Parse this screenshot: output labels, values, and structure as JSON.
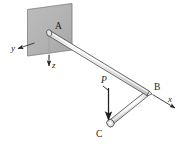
{
  "figure": {
    "kind": "engineering-mechanics-diagram",
    "colors": {
      "plate_fill": "#b4b4b4",
      "plate_stroke": "#6e6e6e",
      "pipe_fill": "#f2f2f2",
      "pipe_stroke": "#3c3c3c",
      "line": "#262626",
      "text": "#1a1a1a",
      "background": "#ffffff"
    }
  },
  "points": {
    "a": "A",
    "b": "B",
    "c": "C"
  },
  "axes": {
    "x": "x",
    "y": "y",
    "z": "z"
  },
  "load": {
    "p": "P"
  }
}
